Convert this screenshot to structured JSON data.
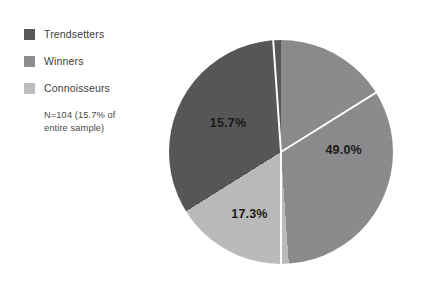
{
  "legend": {
    "items": [
      {
        "label": "Trendsetters",
        "color": "#58585a",
        "swatch_icon": "square-swatch"
      },
      {
        "label": "Winners",
        "color": "#8d8d8f",
        "swatch_icon": "square-swatch"
      },
      {
        "label": "Connoisseurs",
        "color": "#bdbdbe",
        "swatch_icon": "square-swatch"
      }
    ],
    "note_line1": "N=104 (15.7% of",
    "note_line2": "entire sample)"
  },
  "chart_data": {
    "type": "pie",
    "title": "",
    "labels": [
      "Winners",
      "Connoisseurs",
      "Trendsetters"
    ],
    "values": [
      49.0,
      17.3,
      15.7
    ],
    "value_labels": [
      "49.0%",
      "17.3%",
      "15.7%"
    ],
    "colors": [
      "#8d8d8f",
      "#bdbdbe",
      "#58585a"
    ],
    "legend_position": "left",
    "grid": false,
    "start_angle_deg": 0,
    "direction": "clockwise",
    "slice_sweep_deg": [
      176,
      62,
      122
    ],
    "slices": [
      {
        "name": "Winners",
        "value": 49.0,
        "value_label": "49.0%",
        "color": "#8d8d8f",
        "sweep_deg": 176
      },
      {
        "name": "Connoisseurs",
        "value": 17.3,
        "value_label": "17.3%",
        "color": "#bdbdbe",
        "sweep_deg": 62
      },
      {
        "name": "Trendsetters",
        "value": 15.7,
        "value_label": "15.7%",
        "color": "#58585a",
        "sweep_deg": 122
      }
    ],
    "annotation": "N=104 (15.7% of entire sample)",
    "sample_size": 104
  }
}
